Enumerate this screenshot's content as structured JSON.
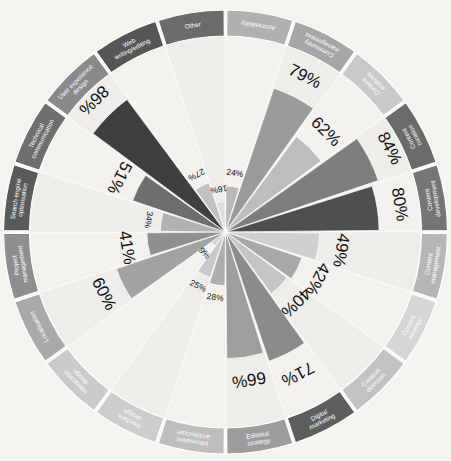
{
  "figure": {
    "title": "",
    "center_x": 225.5,
    "center_y": 232,
    "outer_radius": 222,
    "ring_inner_radius": 196,
    "bar_max_radius": 192,
    "background": "#f4f3f0",
    "ring_stroke": "#ffffff",
    "label_color": "#ffffff",
    "value_color": "#111111"
  },
  "chart_data": {
    "type": "bar",
    "subtype": "polar-rose",
    "title": "",
    "xlabel": "",
    "ylabel": "",
    "ylim": [
      0,
      100
    ],
    "grid": false,
    "legend": "none",
    "units": "%",
    "categories": [
      "Accessibility",
      "Community management",
      "Content analysis",
      "Content curation",
      "Content development",
      "Content management",
      "Content strategy",
      "Creative direction",
      "Digital marketing",
      "Editorial strategy",
      "Information architecture",
      "Interface design",
      "Interaction design",
      "Localisation",
      "Project management",
      "Search engine optimisation",
      "Technical communication",
      "User experience design",
      "Web writing/editing",
      "Other"
    ],
    "values": [
      24,
      79,
      62,
      84,
      80,
      49,
      42,
      40,
      71,
      66,
      28,
      25,
      9,
      60,
      41,
      34,
      51,
      86,
      27,
      16
    ],
    "value_labels": [
      "24%",
      "79%",
      "62%",
      "84%",
      "80%",
      "49%",
      "42%",
      "40%",
      "71%",
      "66%",
      "28%",
      "25%",
      "9%",
      "60%",
      "41%",
      "34%",
      "51%",
      "86%",
      "27%",
      "16%"
    ],
    "slice_colors": [
      "#b9b9b9",
      "#9a9a9a",
      "#bdbdbd",
      "#7e7e7e",
      "#4f4f4f",
      "#cfcfcf",
      "#a8a8a8",
      "#c4c4c4",
      "#8b8b8b",
      "#9e9e9e",
      "#aeaeae",
      "#c8c8c8",
      "#d2d2d2",
      "#a2a2a2",
      "#8f8f8f",
      "#b2b2b2",
      "#6d6d6d",
      "#3f3f3f",
      "#c0c0c0",
      "#e0e0e0"
    ],
    "ring_colors": [
      "#b0b0b0",
      "#a6a6a6",
      "#c9c9c9",
      "#6a6a6a",
      "#757575",
      "#b6b6b6",
      "#d6d6d6",
      "#c2c2c2",
      "#5e5e5e",
      "#9c9c9c",
      "#bdbdbd",
      "#cdcdcd",
      "#cacaca",
      "#a9a9a9",
      "#8e8e8e",
      "#5a5a5a",
      "#6e6e6e",
      "#8a8a8a",
      "#565656",
      "#6b6b6b"
    ],
    "annotations": [
      "Each wedge is sized by the percentage of respondents naming that discipline."
    ]
  },
  "background_text": [
    {
      "text": "",
      "x": 0,
      "y": 0
    }
  ]
}
